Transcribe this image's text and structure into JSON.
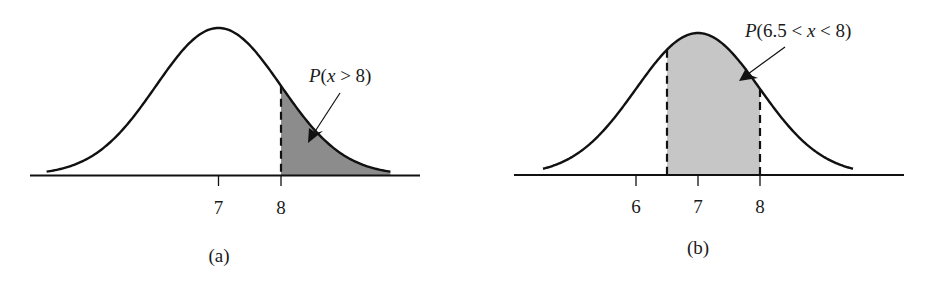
{
  "figure": {
    "panels": [
      {
        "id": "a",
        "caption": "(a)",
        "annotation": {
          "prefix": "P",
          "open": "(",
          "var": "x",
          "expr": " > 8",
          "close": ")"
        },
        "shade_color": "#8c8c8c"
      },
      {
        "id": "b",
        "caption": "(b)",
        "annotation": {
          "prefix": "P",
          "open": "(6.5 < ",
          "var": "x",
          "expr": " < 8",
          "close": ")"
        },
        "shade_color": "#c6c6c6"
      }
    ]
  },
  "chart_data": [
    {
      "type": "area",
      "title": "",
      "caption": "(a)",
      "distribution": "normal",
      "mean": 7,
      "std": 1,
      "xlabel": "",
      "ylabel": "",
      "x_ticks": [
        7,
        8
      ],
      "x_tick_labels": [
        "7",
        "8"
      ],
      "shaded_region": {
        "from": 8,
        "to": "inf"
      },
      "annotations": [
        {
          "text": "P(x > 8)",
          "points_to": "shaded region (right tail beyond 8)"
        }
      ],
      "shade_color": "#8c8c8c",
      "grid": false,
      "legend": false
    },
    {
      "type": "area",
      "title": "",
      "caption": "(b)",
      "distribution": "normal",
      "mean": 7,
      "std": 1,
      "xlabel": "",
      "ylabel": "",
      "x_ticks": [
        6,
        7,
        8
      ],
      "x_tick_labels": [
        "6",
        "7",
        "8"
      ],
      "shaded_region": {
        "from": 6.5,
        "to": 8
      },
      "annotations": [
        {
          "text": "P(6.5 < x < 8)",
          "points_to": "shaded region between 6.5 and 8"
        }
      ],
      "shade_color": "#c6c6c6",
      "grid": false,
      "legend": false
    }
  ]
}
